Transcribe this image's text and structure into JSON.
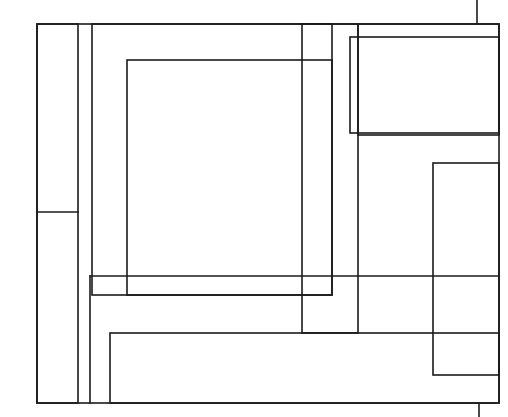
{
  "figure": {
    "canvas": {
      "width": 508,
      "height": 417,
      "background_color": "#ffffff"
    },
    "style": {
      "stroke_color": "#1b1b1b",
      "stroke_width": 1.6,
      "fill": "none"
    },
    "shapes": [
      {
        "name": "outer-frame-rect",
        "kind": "rect",
        "x": 37,
        "y": 24,
        "width": 462,
        "height": 379,
        "label": "Outer frame"
      },
      {
        "name": "left-narrow-column-rect",
        "kind": "rect",
        "x": 37,
        "y": 24,
        "width": 41,
        "height": 379,
        "label": "Left narrow column"
      },
      {
        "name": "upper-left-large-rect",
        "kind": "rect",
        "x": 92,
        "y": 24,
        "width": 240,
        "height": 271,
        "label": "Upper left large rectangle"
      },
      {
        "name": "inner-center-rect",
        "kind": "rect",
        "x": 127,
        "y": 60,
        "width": 205,
        "height": 235,
        "label": "Innermost centre rectangle"
      },
      {
        "name": "center-tall-narrow-rect",
        "kind": "rect",
        "x": 302,
        "y": 24,
        "width": 56,
        "height": 309,
        "label": "Centre tall narrow rectangle"
      },
      {
        "name": "top-right-inner-rect",
        "kind": "rect",
        "x": 350,
        "y": 37,
        "width": 149,
        "height": 96,
        "label": "Top right inner rectangle"
      },
      {
        "name": "top-right-outer-rect",
        "kind": "rect",
        "x": 358,
        "y": 24,
        "width": 141,
        "height": 111,
        "label": "Top right outer rectangle"
      },
      {
        "name": "right-tall-rect",
        "kind": "rect",
        "x": 433,
        "y": 163,
        "width": 66,
        "height": 212,
        "label": "Right tall rectangle"
      },
      {
        "name": "bottom-wide-rect",
        "kind": "rect",
        "x": 110,
        "y": 333,
        "width": 389,
        "height": 70,
        "label": "Bottom wide rectangle"
      }
    ],
    "segments": [
      {
        "name": "top-stub-vertical-line",
        "kind": "line",
        "x1": 477,
        "y1": 0,
        "x2": 477,
        "y2": 24,
        "label": "Short vertical stub above the top edge"
      },
      {
        "name": "bottom-stub-vertical-line",
        "kind": "line",
        "x1": 479,
        "y1": 403,
        "x2": 479,
        "y2": 417,
        "label": "Short vertical stub below the bottom edge"
      },
      {
        "name": "left-column-divider-line",
        "kind": "line",
        "x1": 37,
        "y1": 212,
        "x2": 78,
        "y2": 212,
        "label": "Horizontal divider inside left narrow column"
      },
      {
        "name": "mid-horizontal-long-line",
        "kind": "line",
        "x1": 90,
        "y1": 276,
        "x2": 499,
        "y2": 276,
        "label": "Long horizontal line across the middle"
      },
      {
        "name": "left-column-lower-vertical-line",
        "kind": "line",
        "x1": 90,
        "y1": 276,
        "x2": 90,
        "y2": 403,
        "label": "Vertical from mid horizontal down to bottom edge"
      }
    ]
  }
}
